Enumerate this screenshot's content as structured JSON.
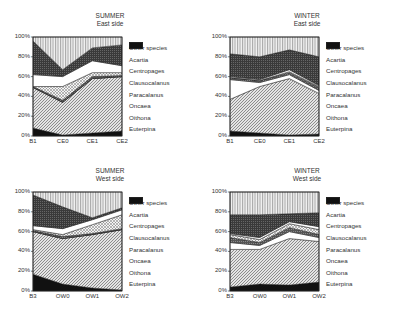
{
  "species": [
    "Euterpina",
    "Oithona",
    "Oncaea",
    "Paracalanus",
    "Clausocalanus",
    "Centropages",
    "Acartia",
    "Other species"
  ],
  "legend_labels": [
    "Other species",
    "Acartia",
    "Centropages",
    "Clausocalanus",
    "Paracalanus",
    "Oncaea",
    "Oithona",
    "Euterpina"
  ],
  "y_ticks": [
    "0%",
    "20%",
    "40%",
    "60%",
    "80%",
    "100%"
  ],
  "panels": [
    {
      "season": "SUMMER",
      "side": "East side"
    },
    {
      "season": "WINTER",
      "side": "East side"
    },
    {
      "season": "SUMMER",
      "side": "West side"
    },
    {
      "season": "WINTER",
      "side": "West side"
    }
  ],
  "chart_data": [
    {
      "type": "area",
      "title": "SUMMER East side",
      "xlabel": "",
      "ylabel": "",
      "ylim": [
        0,
        100
      ],
      "stacked": true,
      "percent": true,
      "categories": [
        "B1",
        "CE0",
        "CE1",
        "CE2"
      ],
      "series": [
        {
          "name": "Euterpina",
          "values": [
            8,
            1,
            3,
            5
          ]
        },
        {
          "name": "Oithona",
          "values": [
            41,
            33,
            55,
            55
          ]
        },
        {
          "name": "Oncaea",
          "values": [
            0,
            0,
            0,
            0
          ]
        },
        {
          "name": "Paracalanus",
          "values": [
            1,
            2,
            2,
            1
          ]
        },
        {
          "name": "Clausocalanus",
          "values": [
            0,
            14,
            4,
            3
          ]
        },
        {
          "name": "Centropages",
          "values": [
            12,
            10,
            12,
            7
          ]
        },
        {
          "name": "Acartia",
          "values": [
            34,
            7,
            13,
            21
          ]
        },
        {
          "name": "Other species",
          "values": [
            4,
            33,
            11,
            8
          ]
        }
      ],
      "legend_position": "right"
    },
    {
      "type": "area",
      "title": "WINTER East side",
      "xlabel": "",
      "ylabel": "",
      "ylim": [
        0,
        100
      ],
      "stacked": true,
      "percent": true,
      "categories": [
        "B1",
        "CE0",
        "CE1",
        "CE2"
      ],
      "series": [
        {
          "name": "Euterpina",
          "values": [
            5,
            3,
            1,
            2
          ]
        },
        {
          "name": "Oithona",
          "values": [
            32,
            47,
            57,
            41
          ]
        },
        {
          "name": "Oncaea",
          "values": [
            20,
            4,
            4,
            3
          ]
        },
        {
          "name": "Paracalanus",
          "values": [
            2,
            2,
            2,
            3
          ]
        },
        {
          "name": "Clausocalanus",
          "values": [
            0,
            0,
            1,
            1
          ]
        },
        {
          "name": "Centropages",
          "values": [
            1,
            1,
            2,
            1
          ]
        },
        {
          "name": "Acartia",
          "values": [
            23,
            23,
            20,
            29
          ]
        },
        {
          "name": "Other species",
          "values": [
            17,
            20,
            13,
            20
          ]
        }
      ],
      "legend_position": "right"
    },
    {
      "type": "area",
      "title": "SUMMER West side",
      "xlabel": "",
      "ylabel": "",
      "ylim": [
        0,
        100
      ],
      "stacked": true,
      "percent": true,
      "categories": [
        "B3",
        "OW0",
        "OW1",
        "OW2"
      ],
      "series": [
        {
          "name": "Euterpina",
          "values": [
            17,
            7,
            3,
            1
          ]
        },
        {
          "name": "Oithona",
          "values": [
            43,
            46,
            54,
            61
          ]
        },
        {
          "name": "Oncaea",
          "values": [
            0,
            0,
            0,
            0
          ]
        },
        {
          "name": "Paracalanus",
          "values": [
            1,
            2,
            1,
            1
          ]
        },
        {
          "name": "Clausocalanus",
          "values": [
            1,
            2,
            9,
            14
          ]
        },
        {
          "name": "Centropages",
          "values": [
            4,
            6,
            5,
            5
          ]
        },
        {
          "name": "Acartia",
          "values": [
            31,
            22,
            2,
            2
          ]
        },
        {
          "name": "Other species",
          "values": [
            3,
            15,
            26,
            16
          ]
        }
      ],
      "legend_position": "right"
    },
    {
      "type": "area",
      "title": "WINTER West side",
      "xlabel": "",
      "ylabel": "",
      "ylim": [
        0,
        100
      ],
      "stacked": true,
      "percent": true,
      "categories": [
        "B3",
        "OW0",
        "OW1",
        "OW2"
      ],
      "series": [
        {
          "name": "Euterpina",
          "values": [
            4,
            7,
            6,
            9
          ]
        },
        {
          "name": "Oithona",
          "values": [
            38,
            35,
            47,
            41
          ]
        },
        {
          "name": "Oncaea",
          "values": [
            7,
            4,
            7,
            4
          ]
        },
        {
          "name": "Paracalanus",
          "values": [
            5,
            3,
            4,
            3
          ]
        },
        {
          "name": "Clausocalanus",
          "values": [
            3,
            3,
            4,
            5
          ]
        },
        {
          "name": "Centropages",
          "values": [
            1,
            2,
            2,
            3
          ]
        },
        {
          "name": "Acartia",
          "values": [
            19,
            23,
            8,
            14
          ]
        },
        {
          "name": "Other species",
          "values": [
            23,
            23,
            22,
            21
          ]
        }
      ],
      "legend_position": "right"
    }
  ]
}
